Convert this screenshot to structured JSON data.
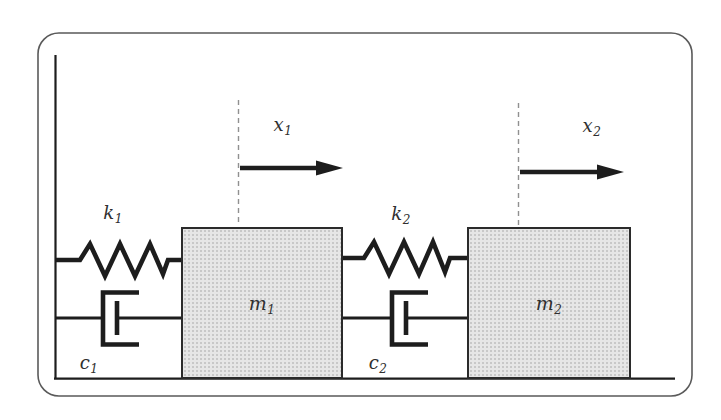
{
  "colors": {
    "background": "#ffffff",
    "frame": "#5a5a5a",
    "line": "#1d1d1d",
    "dashed_line": "#909090",
    "mass_fill": "#e6e6e6",
    "mass_dot": "#c8c8c8",
    "mass_border": "#2b2b2b",
    "label_color": "#2f2f2f"
  },
  "labels": {
    "x1": {
      "base": "x",
      "sub": "1"
    },
    "x2": {
      "base": "x",
      "sub": "2"
    },
    "k1": {
      "base": "k",
      "sub": "1"
    },
    "k2": {
      "base": "k",
      "sub": "2"
    },
    "c1": {
      "base": "c",
      "sub": "1"
    },
    "c2": {
      "base": "c",
      "sub": "2"
    },
    "m1": {
      "base": "m",
      "sub": "1"
    },
    "m2": {
      "base": "m",
      "sub": "2"
    }
  }
}
